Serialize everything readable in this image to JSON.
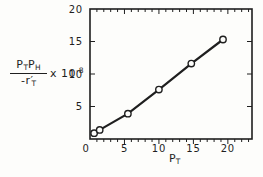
{
  "figure": {
    "background": "#fdfdfb",
    "ink": "#1f1f1f"
  },
  "y_axis_label": {
    "numerator_base1": "P",
    "numerator_sub1": "T",
    "numerator_base2": "P",
    "numerator_sub2": "H",
    "denominator_base": "-r′",
    "denominator_sub": "T",
    "multiplier_base": "x 10",
    "multiplier_exponent": "-8"
  },
  "x_axis_label": {
    "base": "P",
    "sub": "T"
  },
  "chart_data": {
    "type": "scatter",
    "title": "",
    "xlabel": "P_T",
    "ylabel": "(P_T P_H / -r'_T) x 10^-8",
    "points": [
      [
        0.6,
        0.9
      ],
      [
        1.4,
        1.4
      ],
      [
        5.5,
        3.9
      ],
      [
        10.0,
        7.6
      ],
      [
        14.7,
        11.6
      ],
      [
        19.3,
        15.3
      ]
    ],
    "line": true,
    "marker": "open-circle",
    "xlim": [
      0,
      23.5
    ],
    "ylim": [
      0,
      20
    ],
    "xticks": [
      0,
      5,
      10,
      15,
      20
    ],
    "yticks": [
      0,
      5,
      10,
      15,
      20
    ],
    "minor_tick_step": 1,
    "grid": false,
    "legend": "none"
  }
}
